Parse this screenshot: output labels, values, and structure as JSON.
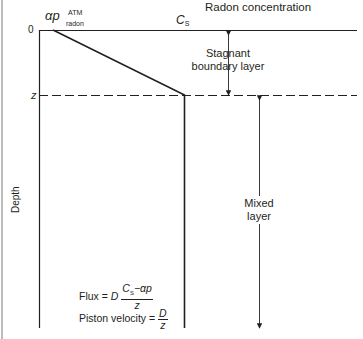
{
  "diagram": {
    "title": "Radon concentration",
    "surface_concentration_label": "C",
    "surface_concentration_sub": "S",
    "atm_label_main": "αp",
    "atm_label_sup": "ATM",
    "atm_label_sub": "radon",
    "depth_zero_label": "0",
    "depth_z_label": "z",
    "y_axis_label": "Depth",
    "stagnant_layer_label_line1": "Stagnant",
    "stagnant_layer_label_line2": "boundary layer",
    "mixed_layer_label_line1": "Mixed",
    "mixed_layer_label_line2": "layer",
    "flux_equation": {
      "lhs": "Flux = ",
      "coef": "D",
      "numerator": "C",
      "numerator_sub": "S",
      "numerator_rest": "−αp",
      "denominator": "z"
    },
    "piston_equation": {
      "lhs": "Piston velocity = ",
      "numerator": "D",
      "denominator": "z"
    },
    "colors": {
      "line": "#231f20",
      "text": "#231f20",
      "edge": "#bdbdbd"
    }
  }
}
